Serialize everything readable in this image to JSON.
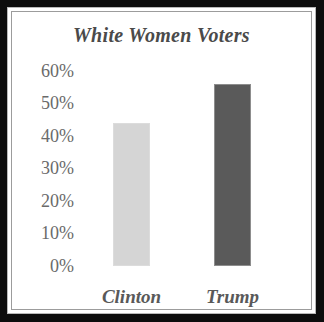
{
  "chart_data": {
    "type": "bar",
    "title": "White Women Voters",
    "xlabel": "",
    "ylabel": "",
    "categories": [
      "Clinton",
      "Trump"
    ],
    "values": [
      44,
      56
    ],
    "ylim": [
      0,
      60
    ],
    "ytick_labels": [
      "60%",
      "50%",
      "40%",
      "30%",
      "20%",
      "10%",
      "0%"
    ],
    "ytick_values": [
      60,
      50,
      40,
      30,
      20,
      10,
      0
    ],
    "grid": false,
    "legend": "none",
    "series": [
      {
        "name": "White Women Voters",
        "values": [
          44,
          56
        ]
      }
    ],
    "bar_colors": [
      "#d5d5d5",
      "#5a5a5a"
    ],
    "background_color": "#ffffff",
    "frame_color": "#0d0d0d",
    "title_color": "#4a4a4a",
    "tick_color": "#6a6a6a",
    "label_color": "#595959"
  }
}
